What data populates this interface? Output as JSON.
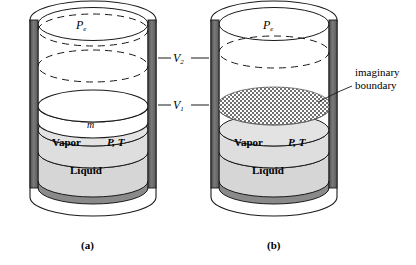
{
  "figure": {
    "panels": [
      {
        "id": "a",
        "caption": "(a)",
        "labels": {
          "external_pressure": "P",
          "external_pressure_sub": "e",
          "piston_mass": "m",
          "vapor": "Vapor",
          "state": "P, T",
          "liquid": "Liquid"
        }
      },
      {
        "id": "b",
        "caption": "(b)",
        "labels": {
          "external_pressure": "P",
          "external_pressure_sub": "e",
          "vapor": "Vapor",
          "state": "P, T",
          "liquid": "Liquid",
          "annotation_line1": "imaginary",
          "annotation_line2": "boundary"
        }
      }
    ],
    "volume_markers": [
      {
        "symbol": "V",
        "sub": "2",
        "name": "volume-2"
      },
      {
        "symbol": "V",
        "sub": "1",
        "name": "volume-1"
      }
    ]
  },
  "colors": {
    "wall": "#6d6d6d",
    "wall_dark": "#4a4a4a",
    "liquid_fill": "#d6d6d6",
    "vapor_fill": "#dedede",
    "outline": "#1a1a1a",
    "hatch": "#8a8a8a",
    "background": "#ffffff"
  }
}
